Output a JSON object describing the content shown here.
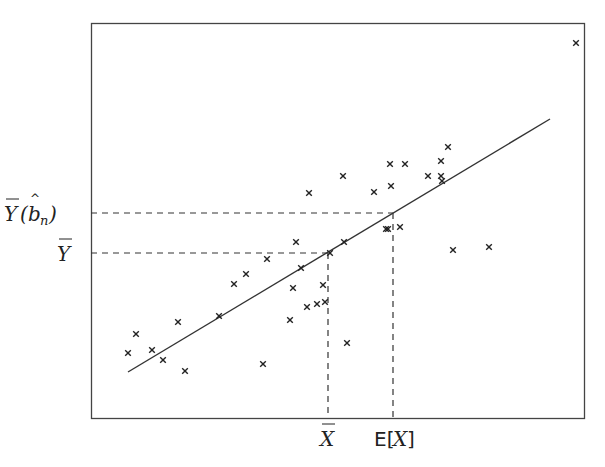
{
  "chart_data": {
    "type": "scatter",
    "title": "",
    "xlabel": "",
    "ylabel": "",
    "grid": false,
    "legend": null,
    "frame_px": {
      "left": 91,
      "top": 23,
      "right": 584,
      "bottom": 418
    },
    "points_px": [
      [
        128,
        353
      ],
      [
        136,
        334
      ],
      [
        152,
        350
      ],
      [
        163,
        360
      ],
      [
        178,
        322
      ],
      [
        185,
        371
      ],
      [
        219,
        316
      ],
      [
        234,
        284
      ],
      [
        246,
        274
      ],
      [
        267,
        259
      ],
      [
        263,
        364
      ],
      [
        290,
        320
      ],
      [
        293,
        288
      ],
      [
        296,
        242
      ],
      [
        301,
        268
      ],
      [
        307,
        307
      ],
      [
        309,
        193
      ],
      [
        317,
        304
      ],
      [
        323,
        285
      ],
      [
        325,
        302
      ],
      [
        330,
        253
      ],
      [
        343,
        176
      ],
      [
        344,
        242
      ],
      [
        347,
        343
      ],
      [
        374,
        192
      ],
      [
        386,
        229
      ],
      [
        388,
        229
      ],
      [
        390,
        164
      ],
      [
        391,
        186
      ],
      [
        400,
        227
      ],
      [
        405,
        164
      ],
      [
        428,
        176
      ],
      [
        441,
        161
      ],
      [
        441,
        176
      ],
      [
        442,
        181
      ],
      [
        448,
        147
      ],
      [
        453,
        250
      ],
      [
        489,
        247
      ],
      [
        576,
        43
      ]
    ],
    "regression_line_px": {
      "x1": 128,
      "y1": 372,
      "x2": 550,
      "y2": 119
    },
    "reference_lines": [
      {
        "type": "horizontal-dashed",
        "y_px": 213,
        "x_end_px": 393,
        "label": "Ȳ(b̂ₙ)"
      },
      {
        "type": "horizontal-dashed",
        "y_px": 253,
        "x_end_px": 328,
        "label": "Ȳ"
      },
      {
        "type": "vertical-dashed",
        "x_px": 328,
        "y_start_px": 253,
        "label": "X̄"
      },
      {
        "type": "vertical-dashed",
        "x_px": 393,
        "y_start_px": 213,
        "label": "E[X]"
      }
    ],
    "annotations": {
      "y_labels": [
        "Ȳ(b̂ₙ)",
        "Ȳ"
      ],
      "x_labels": [
        "X̄",
        "E[X]"
      ]
    }
  },
  "labels": {
    "y_bn_main": "Y",
    "y_bn_paren_open": "(",
    "y_bn_b": "b",
    "y_bn_sub": "n",
    "y_bn_paren_close": ")",
    "y_bar": "Y",
    "x_bar": "X",
    "ex_prefix": "E[",
    "ex_x": "X",
    "ex_suffix": "]"
  }
}
